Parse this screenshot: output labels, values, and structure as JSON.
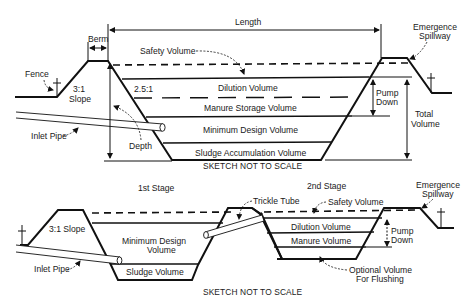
{
  "diagram_top": {
    "labels": {
      "length": "Length",
      "berm": "Berm",
      "fence": "Fence",
      "slope_outer_1": "3:1",
      "slope_outer_2": "Slope",
      "slope_inner": "2.5:1",
      "safety_volume": "Safety Volume",
      "dilution_volume": "Dilution Volume",
      "manure_storage_volume": "Manure Storage Volume",
      "minimum_design_volume": "Minimum Design Volume",
      "sludge_accumulation_volume": "Sludge Accumulation Volume",
      "inlet_pipe": "Inlet Pipe",
      "depth": "Depth",
      "pump_down_1": "Pump",
      "pump_down_2": "Down",
      "total_volume_1": "Total",
      "total_volume_2": "Volume",
      "emergence_spillway_1": "Emergence",
      "emergence_spillway_2": "Spillway",
      "note": "SKETCH NOT TO SCALE"
    }
  },
  "diagram_bottom": {
    "labels": {
      "stage1": "1st Stage",
      "stage2": "2nd Stage",
      "slope": "3:1 Slope",
      "minimum_design_volume_1": "Minimum Design",
      "minimum_design_volume_2": "Volume",
      "sludge_volume": "Sludge Volume",
      "inlet_pipe": "Inlet Pipe",
      "trickle_tube": "Trickle Tube",
      "safety_volume": "Safety Volume",
      "dilution_volume": "Dilution Volume",
      "manure_volume": "Manure Volume",
      "pump_down_1": "Pump",
      "pump_down_2": "Down",
      "emergence_spillway_1": "Emergence",
      "emergence_spillway_2": "Spillway",
      "optional_volume_1": "Optional Volume",
      "optional_volume_2": "For Flushing",
      "note": "SKETCH NOT TO SCALE"
    }
  }
}
